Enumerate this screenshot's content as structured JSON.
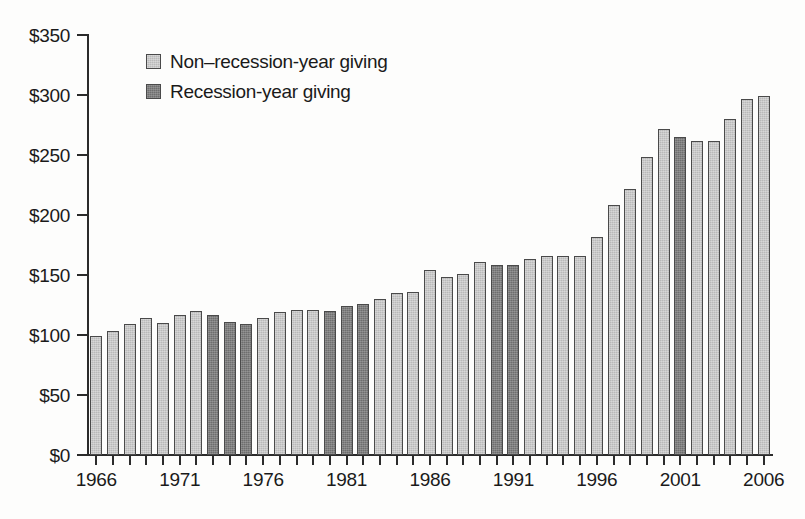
{
  "chart_data": {
    "type": "bar",
    "title": "",
    "subtitle": "",
    "xlabel": "",
    "ylabel": "",
    "ylim": [
      0,
      350
    ],
    "ytick_labels": [
      "$0",
      "$50",
      "$100",
      "$150",
      "$200",
      "$250",
      "$300",
      "$350"
    ],
    "ytick_values": [
      0,
      50,
      100,
      150,
      200,
      250,
      300,
      350
    ],
    "xtick_labels": [
      "1966",
      "1971",
      "1976",
      "1981",
      "1986",
      "1991",
      "1996",
      "2001",
      "2006"
    ],
    "xtick_values": [
      1966,
      1971,
      1976,
      1981,
      1986,
      1991,
      1996,
      2001,
      2006
    ],
    "grid": false,
    "legend_position": "upper-left-inside",
    "categories": [
      "1966",
      "1967",
      "1968",
      "1969",
      "1970",
      "1971",
      "1972",
      "1973",
      "1974",
      "1975",
      "1976",
      "1977",
      "1978",
      "1979",
      "1980",
      "1981",
      "1982",
      "1983",
      "1984",
      "1985",
      "1986",
      "1987",
      "1988",
      "1989",
      "1990",
      "1991",
      "1992",
      "1993",
      "1994",
      "1995",
      "1996",
      "1997",
      "1998",
      "1999",
      "2000",
      "2001",
      "2002",
      "2003",
      "2004",
      "2005",
      "2006"
    ],
    "values": [
      99,
      103,
      109,
      114,
      110,
      117,
      120,
      117,
      111,
      109,
      114,
      119,
      121,
      121,
      120,
      124,
      126,
      130,
      135,
      136,
      154,
      148,
      151,
      161,
      158,
      158,
      163,
      166,
      166,
      166,
      182,
      208,
      222,
      248,
      272,
      265,
      262,
      262,
      280,
      297,
      299
    ],
    "recession_flags": [
      false,
      false,
      false,
      false,
      false,
      false,
      false,
      true,
      true,
      true,
      false,
      false,
      false,
      false,
      true,
      true,
      true,
      false,
      false,
      false,
      false,
      false,
      false,
      false,
      true,
      true,
      false,
      false,
      false,
      false,
      false,
      false,
      false,
      false,
      false,
      true,
      false,
      false,
      false,
      false,
      false
    ],
    "series": [
      {
        "name": "Non-recession-year giving",
        "color": "#b9b9b9"
      },
      {
        "name": "Recession-year giving",
        "color": "#6e6e6e"
      }
    ]
  },
  "legend": {
    "items": [
      {
        "label": "Non–recession-year giving",
        "kind": "non-recession"
      },
      {
        "label": "Recession-year giving",
        "kind": "recession"
      }
    ]
  },
  "colors": {
    "non_recession": "#b9b9b9",
    "recession": "#6e6e6e",
    "axis": "#2b2b2b",
    "background": "#fdfdfc",
    "text": "#1a1a1a"
  }
}
